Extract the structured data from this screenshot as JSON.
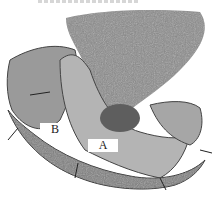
{
  "figure": {
    "labels": {
      "a": "A",
      "b": "B"
    }
  }
}
